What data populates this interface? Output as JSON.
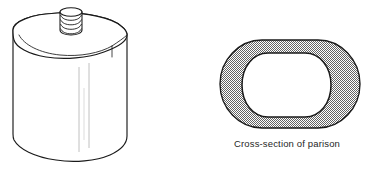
{
  "figure": {
    "background_color": "#ffffff",
    "line_color": "#1a1a1a",
    "hatch_color": "#9a9a9a",
    "fill_color": "#ffffff"
  },
  "bottle": {
    "label": "blow-molded rectangular bottle",
    "neck": {
      "label": "threaded neck finish",
      "thread_count": 4
    },
    "body": {
      "label": "flat oval bottle body",
      "parting_lines": 2
    }
  },
  "cross_section": {
    "caption": "Cross-section of parison",
    "shape": "rounded rectangle annulus",
    "wall_fill": "hatched gray",
    "bore_fill": "white"
  }
}
